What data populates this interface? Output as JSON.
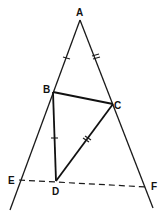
{
  "diagram": {
    "type": "geometry",
    "points": {
      "A": {
        "label": "A",
        "x": 80,
        "y": 20
      },
      "B": {
        "label": "B",
        "x": 53,
        "y": 92
      },
      "C": {
        "label": "C",
        "x": 113,
        "y": 104
      },
      "D": {
        "label": "D",
        "x": 56,
        "y": 181
      },
      "E": {
        "label": "E",
        "x": 19,
        "y": 180
      },
      "F": {
        "label": "F",
        "x": 147,
        "y": 187
      }
    },
    "segments": [
      {
        "from": "A",
        "to": "E",
        "style": "solid",
        "extended": true
      },
      {
        "from": "A",
        "to": "F",
        "style": "solid",
        "extended": true
      },
      {
        "from": "B",
        "to": "C",
        "style": "solid"
      },
      {
        "from": "B",
        "to": "D",
        "style": "solid"
      },
      {
        "from": "C",
        "to": "D",
        "style": "solid"
      },
      {
        "from": "E",
        "to": "F",
        "style": "dashed"
      }
    ],
    "tick_marks": [
      {
        "segment": "AB",
        "count": 1
      },
      {
        "segment": "AC",
        "count": 2
      },
      {
        "segment": "BD",
        "count": 1
      },
      {
        "segment": "CD",
        "count": 2
      }
    ]
  }
}
